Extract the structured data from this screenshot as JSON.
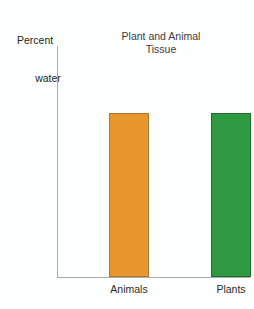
{
  "chart_data": {
    "type": "bar",
    "title": "Plant and Animal Tissue",
    "title_lines": [
      "Plant and Animal",
      "Tissue"
    ],
    "ylabel": "Percent water",
    "ylabel_lines": [
      "Percent",
      "water"
    ],
    "xlabel": "",
    "categories": [
      "Animals",
      "Plants"
    ],
    "values": [
      71,
      71
    ],
    "ylim": [
      0,
      100
    ],
    "yticks": [
      100,
      90,
      80,
      70,
      60,
      50,
      40,
      30,
      20,
      10,
      0
    ],
    "ytick_labels": [
      "100",
      "90",
      "80",
      "70",
      "60",
      "50",
      "40",
      "30",
      "20",
      "10",
      "0"
    ],
    "grid": false,
    "legend": false,
    "legend_position": "none",
    "series": [
      {
        "name": "Percent water",
        "values": [
          71,
          71
        ],
        "colors": [
          "#e8962e",
          "#2e9940"
        ],
        "border_colors": [
          "#b0762b",
          "#1f6b2e"
        ]
      }
    ],
    "colors": {
      "animals_bar": "#e8962e",
      "animals_bar_border": "#b0762b",
      "plants_bar": "#2e9940",
      "plants_bar_border": "#1f6b2e",
      "axis": "#a9a9a9",
      "text": "#231f20",
      "title_text": "#3c3c3c",
      "background": "#fdfefe"
    }
  }
}
